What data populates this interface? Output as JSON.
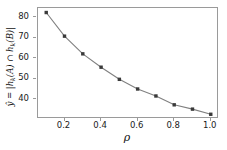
{
  "chart_data": {
    "type": "line",
    "title": "",
    "subtitle": "",
    "xlabel": "ρ",
    "ylabel": "ŷ = |hₖ(A) ∩ hₖ(B)|",
    "x": [
      0.1,
      0.2,
      0.3,
      0.4,
      0.5,
      0.6,
      0.7,
      0.8,
      0.9,
      1.0
    ],
    "values": [
      82.3,
      70.8,
      62.2,
      55.7,
      49.8,
      45.1,
      41.7,
      37.4,
      35.3,
      32.8
    ],
    "series": [
      {
        "name": "ŷ",
        "values": [
          82.3,
          70.8,
          62.2,
          55.7,
          49.8,
          45.1,
          41.7,
          37.4,
          35.3,
          32.8
        ],
        "line_color": "#808080",
        "marker_color": "#3a3a3a",
        "marker": "square"
      }
    ],
    "xlim": [
      0.055,
      1.045
    ],
    "ylim": [
      30.5,
      84.5
    ],
    "xticks": [
      0.2,
      0.4,
      0.6,
      0.8,
      1.0
    ],
    "xticklabels": [
      "0.2",
      "0.4",
      "0.6",
      "0.8",
      "1.0"
    ],
    "yticks": [
      40,
      50,
      60,
      70,
      80
    ],
    "yticklabels": [
      "40",
      "50",
      "60",
      "70",
      "80"
    ],
    "grid": false,
    "legend": null,
    "legend_position": "none",
    "annotations": []
  },
  "axis_label_parts": {
    "y_lead": "ŷ = |h",
    "y_sub_k1": "k",
    "y_mid": "(A) ∩ h",
    "y_sub_k2": "k",
    "y_tail": "(B)|",
    "x_symbol": "ρ"
  },
  "style": {
    "spine_color": "#9a9a9a",
    "tick_color": "#9a9a9a",
    "text_color": "#1a1a1a",
    "background": "#ffffff"
  }
}
